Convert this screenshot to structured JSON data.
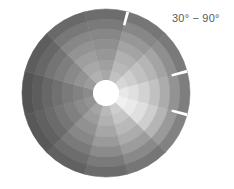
{
  "figure": {
    "name": "polar-sector-heatmap",
    "background_color": "#ffffff"
  },
  "annotation": {
    "text": "30° − 90°",
    "color": "#5a5a5a"
  },
  "geometry": {
    "center_x": 106,
    "center_y": 93,
    "inner_radius": 13,
    "outer_radius": 84,
    "ring_count": 7,
    "sector_count": 12,
    "sector_start_angle_deg": -15,
    "sector_span_deg": 30,
    "hub_color": "#ffffff",
    "gaps": [
      {
        "name": "top-notch",
        "angle_deg": 75,
        "width_deg": 2.0,
        "radius_from": 70,
        "radius_to": 84
      },
      {
        "name": "right-notch",
        "angle_deg": 15,
        "width_deg": 2.0,
        "radius_from": 68,
        "radius_to": 84
      },
      {
        "name": "right-notch-lower",
        "angle_deg": -15,
        "width_deg": 2.0,
        "radius_from": 68,
        "radius_to": 84
      }
    ]
  },
  "chart_data": {
    "type": "heatmap",
    "title": "",
    "subtitle": "",
    "xlabel": "",
    "ylabel": "",
    "annotations": [
      "30° − 90°"
    ],
    "legend": [],
    "grid": false,
    "projection": "polar",
    "colormap": "gray",
    "value_range": [
      0.0,
      1.0
    ],
    "angular_bins_deg": [
      [
        75,
        105
      ],
      [
        45,
        75
      ],
      [
        15,
        45
      ],
      [
        -15,
        15
      ],
      [
        -45,
        -15
      ],
      [
        -75,
        -45
      ],
      [
        -105,
        -75
      ],
      [
        -135,
        -105
      ],
      [
        -165,
        -135
      ],
      [
        165,
        195
      ],
      [
        135,
        165
      ],
      [
        105,
        135
      ]
    ],
    "radial_bins": [
      13,
      23,
      33,
      44,
      54,
      64,
      74,
      84
    ],
    "cells": [
      {
        "sector": 0,
        "values": [
          0.62,
          0.58,
          0.54,
          0.5,
          0.46,
          0.4,
          0.34
        ]
      },
      {
        "sector": 1,
        "values": [
          0.74,
          0.7,
          0.66,
          0.6,
          0.54,
          0.46,
          0.38
        ]
      },
      {
        "sector": 2,
        "values": [
          0.84,
          0.8,
          0.74,
          0.68,
          0.6,
          0.5,
          0.4
        ]
      },
      {
        "sector": 3,
        "values": [
          0.92,
          0.88,
          0.82,
          0.74,
          0.64,
          0.52,
          0.42
        ]
      },
      {
        "sector": 4,
        "values": [
          0.96,
          0.93,
          0.88,
          0.8,
          0.68,
          0.55,
          0.44
        ]
      },
      {
        "sector": 5,
        "values": [
          0.8,
          0.76,
          0.7,
          0.64,
          0.56,
          0.47,
          0.38
        ]
      },
      {
        "sector": 6,
        "values": [
          0.7,
          0.66,
          0.61,
          0.55,
          0.48,
          0.4,
          0.33
        ]
      },
      {
        "sector": 7,
        "values": [
          0.6,
          0.56,
          0.51,
          0.46,
          0.4,
          0.34,
          0.28
        ]
      },
      {
        "sector": 8,
        "values": [
          0.52,
          0.48,
          0.43,
          0.38,
          0.33,
          0.28,
          0.24
        ]
      },
      {
        "sector": 9,
        "values": [
          0.48,
          0.44,
          0.4,
          0.35,
          0.31,
          0.26,
          0.22
        ]
      },
      {
        "sector": 10,
        "values": [
          0.56,
          0.52,
          0.47,
          0.42,
          0.37,
          0.31,
          0.26
        ]
      },
      {
        "sector": 11,
        "values": [
          0.66,
          0.62,
          0.57,
          0.52,
          0.46,
          0.39,
          0.32
        ]
      }
    ]
  }
}
